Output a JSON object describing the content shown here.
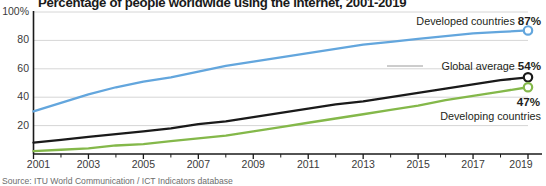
{
  "header": {
    "title": "Percentage of people worldwide using the internet, 2001-2019"
  },
  "source": {
    "text": "Source: ITU World Communication / ICT Indicators database"
  },
  "axis": {
    "y_ticks": [
      "100%",
      "80",
      "60",
      "40",
      "20"
    ],
    "x_ticks": [
      "2001",
      "2003",
      "2005",
      "2007",
      "2009",
      "2011",
      "2013",
      "2015",
      "2017",
      "2019"
    ]
  },
  "annotations": {
    "developed": {
      "label": "Developed countries",
      "value": "87%"
    },
    "global": {
      "label": "Global average",
      "value": "54%"
    },
    "developing": {
      "label": "Developing countries",
      "value": "47%"
    }
  },
  "colors": {
    "developed": "#63a6dd",
    "global": "#1a1a1a",
    "developing": "#84b84a",
    "grid": "#d6d6d6",
    "axis": "#1a1a1a",
    "leader": "#9a9a9a"
  },
  "chart_data": {
    "type": "line",
    "title": "Percentage of people worldwide using the internet, 2001-2019",
    "xlabel": "",
    "ylabel": "Percentage of people using the internet",
    "xlim": [
      2001,
      2019
    ],
    "ylim": [
      0,
      100
    ],
    "grid": true,
    "gridlines_y": [
      20,
      40,
      60,
      80
    ],
    "legend_position": "right-annotations",
    "x": [
      2001,
      2002,
      2003,
      2004,
      2005,
      2006,
      2007,
      2008,
      2009,
      2010,
      2011,
      2012,
      2013,
      2014,
      2015,
      2016,
      2017,
      2018,
      2019
    ],
    "series": [
      {
        "name": "Developed countries",
        "color": "#63a6dd",
        "end_label": "87%",
        "values": [
          30,
          36,
          42,
          47,
          51,
          54,
          58,
          62,
          65,
          68,
          71,
          74,
          77,
          79,
          81,
          83,
          85,
          86,
          87
        ]
      },
      {
        "name": "Global average",
        "color": "#1a1a1a",
        "end_label": "54%",
        "values": [
          8,
          10,
          12,
          14,
          16,
          18,
          21,
          23,
          26,
          29,
          32,
          35,
          37,
          40,
          43,
          46,
          49,
          52,
          54
        ]
      },
      {
        "name": "Developing countries",
        "color": "#84b84a",
        "end_label": "47%",
        "values": [
          2,
          3,
          4,
          6,
          7,
          9,
          11,
          13,
          16,
          19,
          22,
          25,
          28,
          31,
          34,
          38,
          41,
          44,
          47
        ]
      }
    ]
  }
}
